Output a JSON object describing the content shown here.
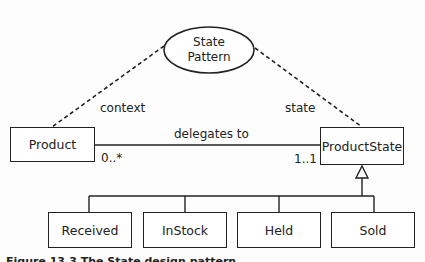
{
  "diagram": {
    "pattern": {
      "line1": "State",
      "line2": "Pattern"
    },
    "context_label": "context",
    "state_label": "state",
    "context_class": "Product",
    "state_class": "ProductState",
    "association": {
      "label": "delegates to",
      "source_multiplicity": "0..*",
      "target_multiplicity": "1..1"
    },
    "subclasses": [
      "Received",
      "InStock",
      "Held",
      "Sold"
    ],
    "colors": {
      "stroke": "#222222",
      "background": "#fdfdfd"
    }
  },
  "caption": {
    "text": "Figure 13.3 The State design pattern"
  }
}
